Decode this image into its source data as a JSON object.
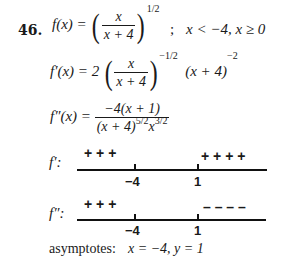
{
  "problem": {
    "number": "46.",
    "f_lhs": "f(x) =",
    "f_frac_num": "x",
    "f_frac_den": "x + 4",
    "f_exponent": "1/2",
    "domain_sep": ";",
    "domain": "x < −4,  x ≥ 0",
    "fp_lhs": "f′(x) = 2",
    "fp_frac_num": "x",
    "fp_frac_den": "x + 4",
    "fp_exponent": "−1/2",
    "fp_tail": "(x + 4)",
    "fp_tail_exp": "−2",
    "fpp_lhs": "f″(x) =",
    "fpp_num": "−4(x + 1)",
    "fpp_den": "(x + 4)",
    "fpp_den_exp1": "5/2",
    "fpp_den_x": "x",
    "fpp_den_exp2": "3/2"
  },
  "sign_charts": [
    {
      "label": "f′:",
      "left_signs": "+ + +",
      "right_signs": "+ + + +",
      "ticks": [
        "−4",
        "1"
      ]
    },
    {
      "label": "f″:",
      "left_signs": "+ + +",
      "right_signs": "– – – –",
      "ticks": [
        "−4",
        "1"
      ]
    }
  ],
  "asymptotes": {
    "label": "asymptotes:",
    "value": "x = −4,  y = 1"
  }
}
